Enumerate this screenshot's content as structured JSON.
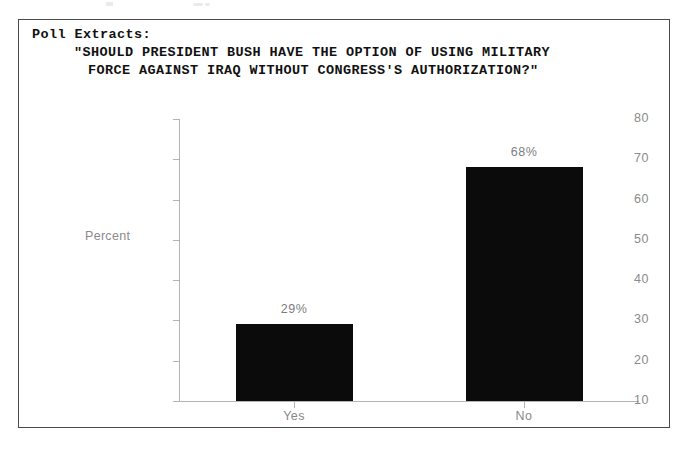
{
  "panel": {
    "header_label": "Poll Extracts:",
    "question_line_1": "\"SHOULD PRESIDENT BUSH HAVE THE OPTION OF USING MILITARY",
    "question_line_2": "FORCE AGAINST IRAQ WITHOUT CONGRESS'S AUTHORIZATION?\""
  },
  "chart_data": {
    "type": "bar",
    "title": "\"SHOULD PRESIDENT BUSH HAVE THE OPTION OF USING MILITARY FORCE AGAINST IRAQ WITHOUT CONGRESS'S AUTHORIZATION?\"",
    "categories": [
      "Yes",
      "No"
    ],
    "values": [
      29,
      68
    ],
    "value_labels": [
      "29%",
      "68%"
    ],
    "xlabel": "",
    "ylabel": "Percent",
    "ylim": [
      10,
      80
    ],
    "yticks": [
      10,
      20,
      30,
      40,
      50,
      60,
      70,
      80
    ],
    "ytick_labels": [
      "10",
      "20",
      "30",
      "40",
      "50",
      "60",
      "70",
      "80"
    ],
    "grid": false,
    "legend": false,
    "bar_color": "#0b0b0b",
    "axis_color": "#b4b4b4",
    "label_color": "#8a8a8a"
  }
}
